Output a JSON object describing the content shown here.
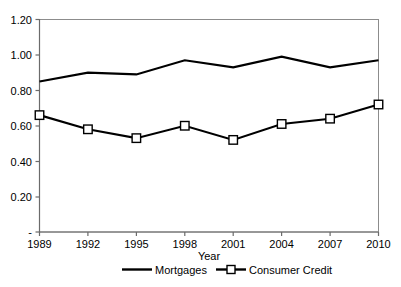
{
  "chart_data": {
    "type": "line",
    "title": "",
    "xlabel": "Year",
    "ylabel": "",
    "x": [
      1989,
      1992,
      1995,
      1998,
      2001,
      2004,
      2007,
      2010
    ],
    "categories": [
      "1989",
      "1992",
      "1995",
      "1998",
      "2001",
      "2004",
      "2007",
      "2010"
    ],
    "series": [
      {
        "name": "Mortgages",
        "values": [
          0.85,
          0.9,
          0.89,
          0.97,
          0.93,
          0.99,
          0.93,
          0.97
        ],
        "marker": "none",
        "line_color": "#000000"
      },
      {
        "name": "Consumer Credit",
        "values": [
          0.66,
          0.58,
          0.53,
          0.6,
          0.52,
          0.61,
          0.64,
          0.72
        ],
        "marker": "square-open",
        "line_color": "#000000"
      }
    ],
    "ylim": [
      0,
      1.2
    ],
    "yticks": [
      0,
      0.2,
      0.4,
      0.6,
      0.8,
      1.0,
      1.2
    ],
    "ytick_labels": [
      "-",
      "0.20",
      "0.40",
      "0.60",
      "0.80",
      "1.00",
      "1.20"
    ],
    "xtick_labels": [
      "1989",
      "1992",
      "1995",
      "1998",
      "2001",
      "2004",
      "2007",
      "2010"
    ],
    "grid": false,
    "legend_position": "bottom",
    "legend_entries": [
      "Mortgages",
      "Consumer Credit"
    ]
  },
  "axes": {
    "x_title": "Year"
  },
  "legend": {
    "items": [
      {
        "label": "Mortgages"
      },
      {
        "label": "Consumer Credit"
      }
    ]
  }
}
